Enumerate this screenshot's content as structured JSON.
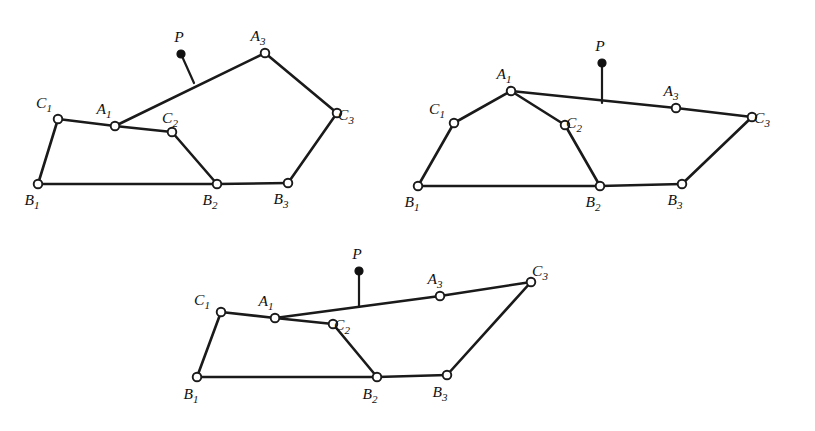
{
  "figure": {
    "background_color": "#ffffff",
    "ink_color": "#1a1a1a",
    "node_fill_open": "#ffffff",
    "node_fill_driver": "#111111",
    "canvas": {
      "width": 815,
      "height": 431
    }
  },
  "labels": {
    "A": "A",
    "B": "B",
    "C": "C",
    "P": "P",
    "sub1": "1",
    "sub2": "2",
    "sub3": "3"
  },
  "diagrams": [
    {
      "id": "diagram-1",
      "name": "configuration-left",
      "nodes": [
        {
          "id": "B1",
          "letter": "B",
          "sub": "1",
          "x": 38,
          "y": 184,
          "kind": "open",
          "label_dx": -6,
          "label_dy": 21
        },
        {
          "id": "C1",
          "letter": "C",
          "sub": "1",
          "x": 58,
          "y": 119,
          "kind": "open",
          "label_dx": -14,
          "label_dy": -11
        },
        {
          "id": "A1",
          "letter": "A",
          "sub": "1",
          "x": 115,
          "y": 126,
          "kind": "open",
          "label_dx": -11,
          "label_dy": -12
        },
        {
          "id": "C2",
          "letter": "C",
          "sub": "2",
          "x": 172,
          "y": 132,
          "kind": "open",
          "label_dx": -2,
          "label_dy": -9
        },
        {
          "id": "B2",
          "letter": "B",
          "sub": "2",
          "x": 217,
          "y": 184,
          "kind": "open",
          "label_dx": -7,
          "label_dy": 21
        },
        {
          "id": "B3",
          "letter": "B",
          "sub": "3",
          "x": 288,
          "y": 183,
          "kind": "open",
          "label_dx": -7,
          "label_dy": 21
        },
        {
          "id": "C3",
          "letter": "C",
          "sub": "3",
          "x": 337,
          "y": 113,
          "kind": "open",
          "label_dx": 9,
          "label_dy": 7
        },
        {
          "id": "A3",
          "letter": "A",
          "sub": "3",
          "x": 265,
          "y": 53,
          "kind": "open",
          "label_dx": -7,
          "label_dy": -12
        },
        {
          "id": "P",
          "letter": "P",
          "sub": "",
          "x": 181,
          "y": 54,
          "kind": "filled",
          "label_dx": -2,
          "label_dy": -12
        }
      ],
      "edges": [
        {
          "from": "B1",
          "to": "C1"
        },
        {
          "from": "C1",
          "to": "A1"
        },
        {
          "from": "A1",
          "to": "C2"
        },
        {
          "from": "C2",
          "to": "B2"
        },
        {
          "from": "B1",
          "to": "B2"
        },
        {
          "from": "B2",
          "to": "B3"
        },
        {
          "from": "B3",
          "to": "C3"
        },
        {
          "from": "C3",
          "to": "A3"
        },
        {
          "from": "A3",
          "to": "A1"
        }
      ],
      "driver_stem": {
        "from": "P",
        "x2": 194,
        "y2": 83
      }
    },
    {
      "id": "diagram-2",
      "name": "configuration-right",
      "nodes": [
        {
          "id": "B1",
          "letter": "B",
          "sub": "1",
          "x": 418,
          "y": 186,
          "kind": "open",
          "label_dx": -6,
          "label_dy": 21
        },
        {
          "id": "C1",
          "letter": "C",
          "sub": "1",
          "x": 454,
          "y": 123,
          "kind": "open",
          "label_dx": -17,
          "label_dy": -9
        },
        {
          "id": "A1",
          "letter": "A",
          "sub": "1",
          "x": 511,
          "y": 91,
          "kind": "open",
          "label_dx": -7,
          "label_dy": -12
        },
        {
          "id": "C2",
          "letter": "C",
          "sub": "2",
          "x": 565,
          "y": 125,
          "kind": "open",
          "label_dx": 9,
          "label_dy": 3
        },
        {
          "id": "B2",
          "letter": "B",
          "sub": "2",
          "x": 600,
          "y": 186,
          "kind": "open",
          "label_dx": -7,
          "label_dy": 21
        },
        {
          "id": "B3",
          "letter": "B",
          "sub": "3",
          "x": 682,
          "y": 184,
          "kind": "open",
          "label_dx": -7,
          "label_dy": 21
        },
        {
          "id": "C3",
          "letter": "C",
          "sub": "3",
          "x": 752,
          "y": 117,
          "kind": "open",
          "label_dx": 10,
          "label_dy": 6
        },
        {
          "id": "A3",
          "letter": "A",
          "sub": "3",
          "x": 676,
          "y": 108,
          "kind": "open",
          "label_dx": -5,
          "label_dy": -12
        },
        {
          "id": "P",
          "letter": "P",
          "sub": "",
          "x": 602,
          "y": 63,
          "kind": "filled",
          "label_dx": -2,
          "label_dy": -12
        }
      ],
      "edges": [
        {
          "from": "B1",
          "to": "C1"
        },
        {
          "from": "C1",
          "to": "A1"
        },
        {
          "from": "A1",
          "to": "C2"
        },
        {
          "from": "C2",
          "to": "B2"
        },
        {
          "from": "B1",
          "to": "B2"
        },
        {
          "from": "B2",
          "to": "B3"
        },
        {
          "from": "B3",
          "to": "C3"
        },
        {
          "from": "C3",
          "to": "A3"
        },
        {
          "from": "A3",
          "to": "A1"
        }
      ],
      "driver_stem": {
        "from": "P",
        "x2": 602,
        "y2": 103
      }
    },
    {
      "id": "diagram-3",
      "name": "configuration-bottom",
      "nodes": [
        {
          "id": "B1",
          "letter": "B",
          "sub": "1",
          "x": 197,
          "y": 377,
          "kind": "open",
          "label_dx": -6,
          "label_dy": 22
        },
        {
          "id": "C1",
          "letter": "C",
          "sub": "1",
          "x": 221,
          "y": 312,
          "kind": "open",
          "label_dx": -19,
          "label_dy": -7
        },
        {
          "id": "A1",
          "letter": "A",
          "sub": "1",
          "x": 275,
          "y": 318,
          "kind": "open",
          "label_dx": -9,
          "label_dy": -12
        },
        {
          "id": "C2",
          "letter": "C",
          "sub": "2",
          "x": 333,
          "y": 324,
          "kind": "open",
          "label_dx": 9,
          "label_dy": 6
        },
        {
          "id": "B2",
          "letter": "B",
          "sub": "2",
          "x": 377,
          "y": 377,
          "kind": "open",
          "label_dx": -7,
          "label_dy": 22
        },
        {
          "id": "B3",
          "letter": "B",
          "sub": "3",
          "x": 447,
          "y": 375,
          "kind": "open",
          "label_dx": -7,
          "label_dy": 22
        },
        {
          "id": "C3",
          "letter": "C",
          "sub": "3",
          "x": 531,
          "y": 282,
          "kind": "open",
          "label_dx": 9,
          "label_dy": -6
        },
        {
          "id": "A3",
          "letter": "A",
          "sub": "3",
          "x": 440,
          "y": 296,
          "kind": "open",
          "label_dx": -5,
          "label_dy": -12
        },
        {
          "id": "P",
          "letter": "P",
          "sub": "",
          "x": 359,
          "y": 271,
          "kind": "filled",
          "label_dx": -2,
          "label_dy": -12
        }
      ],
      "edges": [
        {
          "from": "B1",
          "to": "C1"
        },
        {
          "from": "C1",
          "to": "A1"
        },
        {
          "from": "A1",
          "to": "C2"
        },
        {
          "from": "C2",
          "to": "B2"
        },
        {
          "from": "B1",
          "to": "B2"
        },
        {
          "from": "B2",
          "to": "B3"
        },
        {
          "from": "B3",
          "to": "C3"
        },
        {
          "from": "C3",
          "to": "A3"
        },
        {
          "from": "A3",
          "to": "A1"
        }
      ],
      "driver_stem": {
        "from": "P",
        "x2": 359,
        "y2": 307
      }
    }
  ]
}
